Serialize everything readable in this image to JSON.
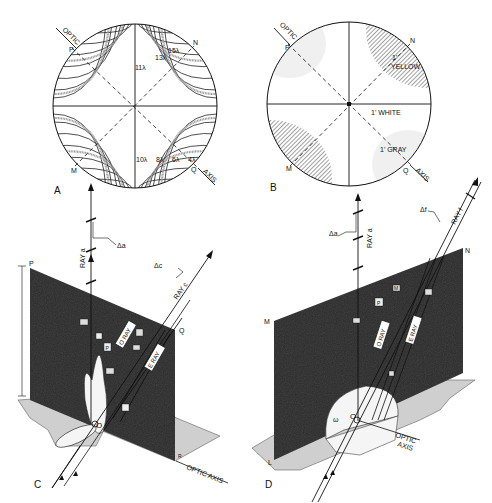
{
  "figure": {
    "panels": [
      {
        "id": "A",
        "letter": "A",
        "type": "interference-figure-isochromes",
        "labels": {
          "optic": "OPTIC",
          "axis": "AXIS",
          "p": "P",
          "n": "N",
          "m": "M",
          "q": "Q"
        },
        "isochrome_orders": [
          "15λ",
          "13λ",
          "11λ",
          "10λ",
          "8λ",
          "6λ",
          "4λ"
        ]
      },
      {
        "id": "B",
        "letter": "B",
        "type": "interference-figure-colors",
        "labels": {
          "optic": "OPTIC",
          "axis": "AXIS",
          "p": "P",
          "n": "N",
          "m": "M",
          "q": "Q",
          "yellow_order": "1'",
          "yellow": "YELLOW",
          "white": "1' WHITE",
          "gray": "1' GRAY"
        }
      },
      {
        "id": "C",
        "letter": "C",
        "type": "ray-diagram-3d",
        "labels": {
          "ray_a": "RAY a",
          "ray_c": "RAY c",
          "delta_a": "Δa",
          "delta_c": "Δc",
          "o_ray": "O RAY",
          "e_ray": "E RAY",
          "p": "P",
          "q": "Q",
          "r": "R",
          "o": "O",
          "optic_axis": "OPTIC AXIS",
          "eps": "ε",
          "omega": "ω",
          "box_p": "P",
          "box_e": "E"
        }
      },
      {
        "id": "D",
        "letter": "D",
        "type": "ray-diagram-3d",
        "labels": {
          "ray_a": "RAY a",
          "ray_f": "RAY f",
          "delta_a": "Δa",
          "delta_f": "Δf",
          "o_ray": "O RAY",
          "e_ray": "E RAY",
          "m": "M",
          "n": "N",
          "l": "L",
          "o": "O",
          "optic": "OPTIC",
          "axis": "AXIS",
          "eps": "ε",
          "omega": "ω",
          "box_p": "P",
          "box_m": "M"
        }
      }
    ]
  },
  "colors": {
    "ink": "#111111",
    "panel_dark": "#2b2b2b",
    "ground_gray": "#cfcfcf",
    "hatch": "#555555",
    "stipple": "#9a9a9a"
  }
}
